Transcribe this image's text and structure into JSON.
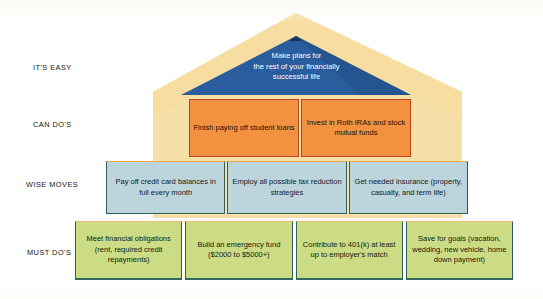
{
  "diagram": {
    "tiers": [
      {
        "label": "IT'S EASY",
        "shape": "roof",
        "items": [
          {
            "text": "Make plans for the rest of your financially successful life"
          }
        ]
      },
      {
        "label": "CAN DO'S",
        "shape": "band",
        "items": [
          {
            "text": "Finish paying off student loans"
          },
          {
            "text": "Invest in Roth IRAs and stock mutual funds"
          }
        ]
      },
      {
        "label": "WISE MOVES",
        "shape": "band",
        "items": [
          {
            "text": "Pay off credit card balances in full every month"
          },
          {
            "text": "Employ all possible tax reduction strategies"
          },
          {
            "text": "Get needed insurance (property, casualty, and term life)"
          }
        ]
      },
      {
        "label": "MUST DO'S",
        "shape": "band",
        "items": [
          {
            "text": "Meet financial obligations (rent, required credit repayments)"
          },
          {
            "text": "Build an emergency fund ($2000 to $5000+)"
          },
          {
            "text": "Contribute to 401(k) at least up to employer's match"
          },
          {
            "text": "Save for goals (vacation, wedding, new vehicle, home down payment)"
          }
        ]
      }
    ],
    "roof_text_lines": [
      "Make plans for",
      "the rest of your financially",
      "successful life"
    ],
    "colors": {
      "roof_outer": "#f7dda0",
      "roof_inner": "#2a5d9e",
      "roof_inner_shadow": "#1d4a7f",
      "house_wall": "#f7e0a8",
      "can_do_fill": "#f2913f",
      "can_do_border": "#c0421f",
      "wise_fill": "#bcd4dc",
      "wise_border": "#2d6158",
      "must_fill": "#cbdc84",
      "must_border": "#2d6158",
      "label_text": "#151515",
      "roof_text": "#ffffff"
    }
  }
}
